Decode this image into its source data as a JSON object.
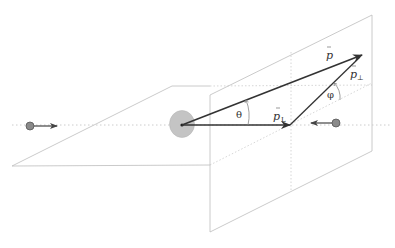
{
  "diagram": {
    "title": "",
    "labels": {
      "p_vector": "p",
      "p_longitudinal": "p",
      "p_longitudinal_sub": "L",
      "p_perp": "p",
      "p_perp_sub": "⊥",
      "theta": "θ",
      "phi": "φ"
    },
    "elements": [
      {
        "id": "beam-axis",
        "type": "dotted-line",
        "description": "collision axis"
      },
      {
        "id": "incoming-particle-left",
        "type": "particle",
        "direction": "right"
      },
      {
        "id": "incoming-particle-right",
        "type": "particle",
        "direction": "left"
      },
      {
        "id": "interaction-point",
        "type": "blob"
      },
      {
        "id": "horizontal-plane",
        "type": "plane"
      },
      {
        "id": "transverse-plane",
        "type": "plane"
      },
      {
        "id": "momentum-vector",
        "type": "arrow",
        "label": "p"
      },
      {
        "id": "longitudinal-component",
        "type": "arrow",
        "label": "p_L"
      },
      {
        "id": "transverse-component",
        "type": "arrow",
        "label": "p_⊥"
      },
      {
        "id": "polar-angle",
        "type": "angle",
        "label": "θ"
      },
      {
        "id": "azimuthal-angle",
        "type": "angle",
        "label": "φ"
      }
    ],
    "colors": {
      "plane_stroke": "#bdbdbd",
      "dotted": "#c8c8c8",
      "vector": "#333333",
      "particle_fill": "#8a8a8a",
      "blob_fill": "#c4c4c4"
    }
  }
}
